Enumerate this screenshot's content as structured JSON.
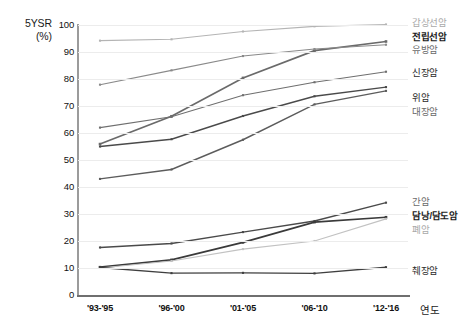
{
  "chart_data": {
    "type": "line",
    "title": "",
    "xlabel": "연도",
    "ylabel": "5YSR (%)",
    "ylim": [
      0,
      100
    ],
    "ytick_step": 10,
    "grid": true,
    "legend_position": "right",
    "categories": [
      "'93-'95",
      "'96-'00",
      "'01-'05",
      "'06-'10",
      "'12-'16"
    ],
    "series": [
      {
        "name": "갑상선암",
        "color": "#b4b4b4",
        "weight": "faint",
        "values": [
          94.2,
          94.7,
          97.6,
          99.5,
          100.2
        ]
      },
      {
        "name": "전립선암",
        "color": "#6a6a6a",
        "weight": "strong",
        "values": [
          55.9,
          66.2,
          80.4,
          90.5,
          93.9
        ]
      },
      {
        "name": "유방암",
        "color": "#8a8a8a",
        "weight": "mid",
        "values": [
          77.9,
          83.2,
          88.5,
          91.1,
          92.7
        ]
      },
      {
        "name": "신장암",
        "color": "#6f6f6f",
        "weight": "mid",
        "values": [
          62.0,
          66.0,
          74.0,
          78.8,
          82.7
        ]
      },
      {
        "name": "위암",
        "color": "#4a4a4a",
        "weight": "dark",
        "values": [
          55.0,
          57.7,
          66.3,
          73.6,
          77.0
        ]
      },
      {
        "name": "대장암",
        "color": "#5c5c5c",
        "weight": "dark",
        "values": [
          43.0,
          46.5,
          57.5,
          70.6,
          75.6
        ]
      },
      {
        "name": "간암",
        "color": "#4a4a4a",
        "weight": "dark",
        "values": [
          17.6,
          19.1,
          23.3,
          27.4,
          34.2
        ]
      },
      {
        "name": "담낭/담도암",
        "color": "#3a3a3a",
        "weight": "strong",
        "values": [
          10.3,
          13.0,
          19.5,
          27.0,
          28.8
        ]
      },
      {
        "name": "폐암",
        "color": "#c2c2c2",
        "weight": "faint",
        "values": [
          10.0,
          12.6,
          17.0,
          20.0,
          28.2
        ]
      },
      {
        "name": "췌장암",
        "color": "#3f3f3f",
        "weight": "dark",
        "values": [
          10.2,
          8.1,
          8.2,
          8.0,
          10.3
        ]
      }
    ]
  },
  "axis": {
    "y_title_line1": "5YSR",
    "y_title_line2": "(%)",
    "y_ticks": [
      "100",
      "90",
      "80",
      "70",
      "60",
      "50",
      "40",
      "30",
      "20",
      "10",
      "0"
    ],
    "x_name": "연도"
  },
  "legend": {
    "top_group": [
      {
        "label": "갑상선암",
        "style": "lg-faint"
      },
      {
        "label": "전립선암",
        "style": "lg-strong"
      },
      {
        "label": "유방암",
        "style": "lg-mid"
      },
      {
        "label": "신장암",
        "style": "lg-dark"
      },
      {
        "label": "위암",
        "style": "lg-dark"
      },
      {
        "label": "대장암",
        "style": "lg-mid"
      }
    ],
    "bottom_group": [
      {
        "label": "간암",
        "style": "lg-mid"
      },
      {
        "label": "담낭/담도암",
        "style": "lg-strong"
      },
      {
        "label": "폐암",
        "style": "lg-faint"
      },
      {
        "label": "췌장암",
        "style": "lg-dark"
      }
    ]
  }
}
